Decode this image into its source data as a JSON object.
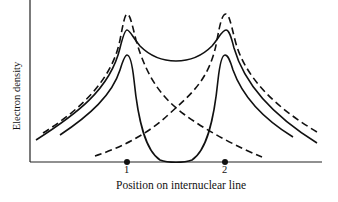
{
  "figure": {
    "y_axis_label": "Electron density",
    "x_axis_label": "Position on internuclear line",
    "nucleus_labels": [
      "1",
      "2"
    ],
    "colors": {
      "line": "#111111",
      "background": "#ffffff"
    },
    "curves": [
      {
        "name": "atomic-density-nucleus-1",
        "style": "dashed",
        "description": "Isolated atom density centered on nucleus 1"
      },
      {
        "name": "atomic-density-nucleus-2",
        "style": "dashed",
        "description": "Isolated atom density centered on nucleus 2"
      },
      {
        "name": "bonding-density",
        "style": "solid",
        "description": "Total density with build-up between nuclei"
      },
      {
        "name": "antibonding-density",
        "style": "solid",
        "description": "Total density with node between nuclei"
      }
    ]
  }
}
